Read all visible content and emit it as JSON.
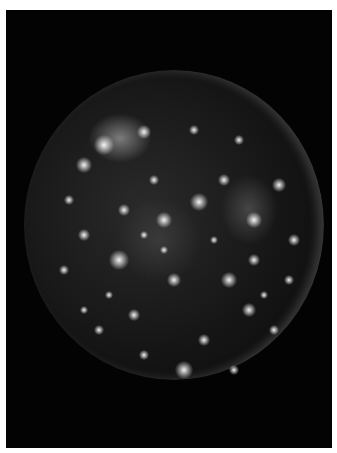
{
  "image": {
    "subject": "cratered moon disk on black background",
    "description": "Grayscale photograph of a heavily cratered moon (bright crater spots on dark surface) against black space, framed with a thin white border",
    "colors": {
      "border": "#ffffff",
      "space": "#030303",
      "crater": "#e8e8e8"
    }
  },
  "spots": [
    [
      80,
      75,
      10
    ],
    [
      120,
      62,
      7
    ],
    [
      60,
      95,
      8
    ],
    [
      140,
      150,
      8
    ],
    [
      175,
      132,
      9
    ],
    [
      230,
      150,
      8
    ],
    [
      255,
      115,
      7
    ],
    [
      95,
      190,
      10
    ],
    [
      150,
      210,
      7
    ],
    [
      205,
      210,
      8
    ],
    [
      225,
      240,
      7
    ],
    [
      60,
      165,
      6
    ],
    [
      40,
      200,
      5
    ],
    [
      110,
      245,
      6
    ],
    [
      180,
      270,
      6
    ],
    [
      160,
      300,
      9
    ],
    [
      230,
      190,
      6
    ],
    [
      270,
      170,
      6
    ],
    [
      200,
      110,
      6
    ],
    [
      100,
      140,
      6
    ],
    [
      130,
      110,
      5
    ],
    [
      250,
      260,
      5
    ],
    [
      75,
      260,
      5
    ],
    [
      210,
      300,
      5
    ],
    [
      120,
      285,
      5
    ],
    [
      45,
      130,
      5
    ],
    [
      170,
      60,
      5
    ],
    [
      215,
      70,
      5
    ],
    [
      265,
      210,
      5
    ],
    [
      140,
      180,
      4
    ],
    [
      85,
      225,
      4
    ],
    [
      190,
      170,
      4
    ],
    [
      240,
      225,
      4
    ],
    [
      120,
      165,
      4
    ],
    [
      60,
      240,
      4
    ]
  ]
}
